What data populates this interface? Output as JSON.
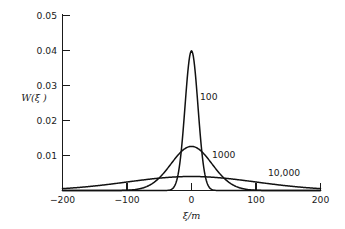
{
  "chart_data": {
    "type": "line",
    "title": "",
    "xlabel": "ξ/m",
    "ylabel": "W(ξ )",
    "xlim": [
      -200,
      200
    ],
    "ylim": [
      0,
      0.05
    ],
    "grid": false,
    "legend_position": "inline-annotations",
    "xticks": [
      -200,
      -100,
      0,
      100,
      200
    ],
    "xtick_labels": [
      "−200",
      "−100",
      "0",
      "100",
      "200"
    ],
    "yticks": [
      0.01,
      0.02,
      0.03,
      0.04,
      0.05
    ],
    "ytick_labels": [
      "0.01",
      "0.02",
      "0.03",
      "0.04",
      "0.05"
    ],
    "series": [
      {
        "name": "100",
        "label": "100",
        "peak_value": 0.0399,
        "peak_x": 0,
        "sigma": 10,
        "annotation": "100"
      },
      {
        "name": "1000",
        "label": "1000",
        "peak_value": 0.0126,
        "peak_x": 0,
        "sigma": 31.6,
        "annotation": "1000"
      },
      {
        "name": "10,000",
        "label": "10,000",
        "peak_value": 0.004,
        "peak_x": 0,
        "sigma": 100,
        "annotation": "10,000"
      }
    ]
  },
  "annotations": {
    "series_100": "100",
    "series_1000": "1000",
    "series_10000": "10,000"
  },
  "axes": {
    "y_axis_title": "W(ξ )",
    "x_axis_title": "ξ/m",
    "y_labels": [
      "0.05",
      "0.04",
      "0.03",
      "0.02",
      "0.01"
    ],
    "x_labels": [
      "−200",
      "−100",
      "0",
      "100",
      "200"
    ]
  },
  "colors": {
    "curve": "#111111",
    "axis": "#1a1a1a",
    "background": "#ffffff"
  }
}
